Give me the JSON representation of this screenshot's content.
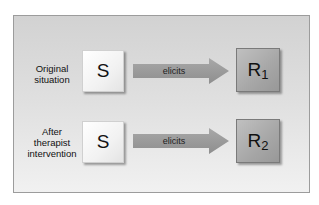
{
  "rows": [
    {
      "label_lines": [
        "Original",
        "situation"
      ],
      "stimulus": "S",
      "arrow_label": "elicits",
      "response": "R",
      "response_subscript": "1"
    },
    {
      "label_lines": [
        "After",
        "therapist",
        "intervention"
      ],
      "stimulus": "S",
      "arrow_label": "elicits",
      "response": "R",
      "response_subscript": "2"
    }
  ],
  "colors": {
    "panel_top": "#d2d2d2",
    "panel_bottom": "#f1f1f1",
    "arrow_fill": "#9a9a9a",
    "response_box": "#a6a6a6",
    "stimulus_box": "#f2f2f2"
  }
}
